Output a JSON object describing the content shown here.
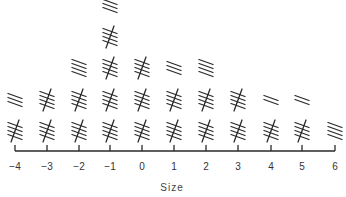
{
  "chart_data": {
    "type": "bar",
    "style": "tally-marks",
    "title": "",
    "xlabel": "Size",
    "ylabel": "",
    "categories": [
      "-4",
      "-3",
      "-2",
      "-1",
      "0",
      "1",
      "2",
      "3",
      "4",
      "5",
      "6"
    ],
    "values": [
      8,
      10,
      14,
      23,
      15,
      13,
      14,
      10,
      7,
      7,
      4
    ],
    "tally_group_size": 5,
    "grid": false,
    "legend": null
  },
  "axis": {
    "title": "Size",
    "tick_labels": [
      "−4",
      "−3",
      "−2",
      "−1",
      "0",
      "1",
      "2",
      "3",
      "4",
      "5",
      "6"
    ]
  },
  "colors": {
    "ink": "#2a2a2a",
    "background": "#ffffff"
  }
}
